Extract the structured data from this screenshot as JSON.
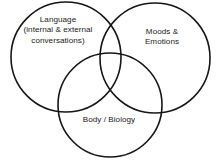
{
  "diagram": {
    "type": "venn-3-circle",
    "background_color": "#ffffff",
    "stroke_color": "#161616",
    "text_color": "#1b1b1b",
    "sets": [
      {
        "id": "language",
        "position": "left",
        "lines": [
          "Language",
          "(internal & external",
          "conversations)"
        ],
        "cx": 66,
        "cy": 57,
        "r": 55
      },
      {
        "id": "moods",
        "position": "right",
        "lines": [
          "Moods &",
          "Emotions"
        ],
        "cx": 155,
        "cy": 58,
        "r": 55
      },
      {
        "id": "body",
        "position": "bottom",
        "lines": [
          "Body / Biology"
        ],
        "cx": 110,
        "cy": 105,
        "r": 52
      }
    ]
  }
}
